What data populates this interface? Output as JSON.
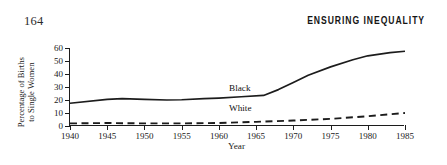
{
  "page": {
    "folio": "164",
    "running_head": "ENSURING INEQUALITY"
  },
  "chart_data": {
    "type": "line",
    "title": "",
    "xlabel": "Year",
    "ylabel": "Percentage of Births to Single Women",
    "ylabel_line1": "Percentage of Births",
    "ylabel_line2": "to Single Women",
    "xlim": [
      1940,
      1985
    ],
    "ylim": [
      0,
      60
    ],
    "yticks": [
      60,
      50,
      40,
      30,
      20,
      10,
      0
    ],
    "ytick_labels": [
      "60",
      "50",
      "40",
      "30",
      "20",
      "10",
      "0"
    ],
    "xticks": [
      1940,
      1945,
      1950,
      1955,
      1960,
      1965,
      1970,
      1975,
      1980,
      1985
    ],
    "xtick_labels": [
      "1940",
      "1945",
      "1950",
      "1955",
      "1960",
      "1965",
      "1970",
      "1975",
      "1980",
      "1985"
    ],
    "grid": false,
    "legend_position": "inline-annotations",
    "annotations": [
      {
        "text": "Black",
        "x": 1961.5,
        "y": 28.5
      },
      {
        "text": "White",
        "x": 1961.5,
        "y": 13.0
      }
    ],
    "series": [
      {
        "name": "Black",
        "style": "solid",
        "color": "#1c1c1c",
        "x": [
          1940,
          1945,
          1947,
          1950,
          1953,
          1955,
          1958,
          1960,
          1963,
          1966,
          1968,
          1970,
          1972,
          1975,
          1978,
          1980,
          1983,
          1985
        ],
        "values": [
          17.5,
          20.5,
          21.0,
          20.5,
          20.0,
          20.2,
          21.0,
          21.5,
          22.5,
          23.5,
          28.0,
          33.5,
          39.0,
          45.5,
          51.0,
          54.0,
          56.5,
          57.5
        ]
      },
      {
        "name": "White",
        "style": "dashed",
        "color": "#1c1c1c",
        "x": [
          1940,
          1945,
          1950,
          1955,
          1960,
          1965,
          1970,
          1975,
          1980,
          1985
        ],
        "values": [
          2.0,
          2.3,
          2.0,
          2.0,
          2.3,
          3.2,
          4.2,
          5.5,
          7.5,
          10.0
        ]
      }
    ]
  }
}
